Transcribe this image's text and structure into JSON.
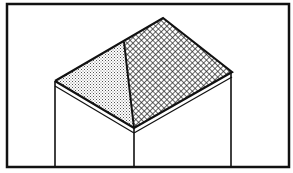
{
  "diagram": {
    "colors": {
      "background": "#ffffff",
      "stroke": "#111111",
      "left_hip_face_pattern": "#555555",
      "main_roof_face_pattern": "#222222"
    },
    "frame": {
      "x": 7,
      "y": 4,
      "width": 282,
      "height": 163
    },
    "roof": {
      "peak": [
        163,
        18
      ],
      "hip_top": [
        124,
        42
      ],
      "left_corner": [
        55,
        81
      ],
      "right_corner": [
        232,
        72
      ],
      "front_corner": [
        134,
        128
      ]
    },
    "walls": {
      "left_x": 55,
      "middle_x": 134,
      "right_x": 231,
      "bottom_y": 167
    },
    "fascia_offset": 6
  }
}
